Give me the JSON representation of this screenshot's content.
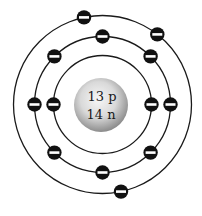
{
  "nucleus": {
    "protons_label": "13 p",
    "neutrons_label": "14 n",
    "protons": 13,
    "neutrons": 14
  },
  "shells": [
    {
      "name": "inner",
      "electrons": 2,
      "angles_deg": [
        180,
        0
      ]
    },
    {
      "name": "middle",
      "electrons": 8,
      "angles_deg": [
        270,
        225,
        180,
        135,
        90,
        45,
        0,
        315
      ]
    },
    {
      "name": "outer",
      "electrons": 3,
      "angles_deg": [
        258,
        308,
        78
      ]
    }
  ],
  "electron_symbol": "minus-sign",
  "colors": {
    "line": "#1a1a1a",
    "electron": "#111111",
    "electron_bar": "#ffffff",
    "nucleus_light": "#f4f4f4",
    "nucleus_dark": "#8a8a8a"
  }
}
